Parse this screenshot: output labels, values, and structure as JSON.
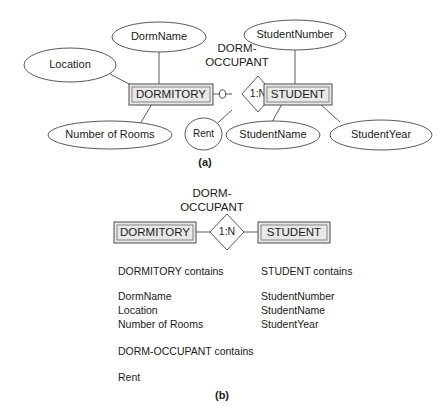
{
  "figure": {
    "panel_a_caption": "(a)",
    "panel_b_caption": "(b)"
  },
  "panel_a": {
    "entities": [
      {
        "id": "dormitory",
        "label": "DORMITORY"
      },
      {
        "id": "student",
        "label": "STUDENT"
      }
    ],
    "relationship": {
      "label_line1": "DORM-",
      "label_line2": "OCCUPANT",
      "cardinality": "1:N",
      "left_marker": "optional-zero-circle",
      "right_marker": "mandatory-one-tick"
    },
    "attributes": [
      {
        "id": "location",
        "label": "Location",
        "owner": "dormitory"
      },
      {
        "id": "dormname",
        "label": "DormName",
        "owner": "dormitory"
      },
      {
        "id": "numrooms",
        "label": "Number of Rooms",
        "owner": "dormitory"
      },
      {
        "id": "studentnumber",
        "label": "StudentNumber",
        "owner": "student"
      },
      {
        "id": "studentname",
        "label": "StudentName",
        "owner": "student"
      },
      {
        "id": "studentyear",
        "label": "StudentYear",
        "owner": "student"
      },
      {
        "id": "rent",
        "label": "Rent",
        "owner": "dorm-occupant"
      }
    ]
  },
  "panel_b": {
    "entities": [
      {
        "id": "dormitory",
        "label": "DORMITORY"
      },
      {
        "id": "student",
        "label": "STUDENT"
      }
    ],
    "relationship": {
      "label_line1": "DORM-",
      "label_line2": "OCCUPANT",
      "cardinality": "1:N"
    },
    "lists": [
      {
        "id": "dormitory-contains",
        "heading": "DORMITORY contains",
        "items": [
          "DormName",
          "Location",
          "Number of Rooms"
        ]
      },
      {
        "id": "student-contains",
        "heading": "STUDENT contains",
        "items": [
          "StudentNumber",
          "StudentName",
          "StudentYear"
        ]
      },
      {
        "id": "dorm-occupant-contains",
        "heading": "DORM-OCCUPANT contains",
        "items": [
          "Rent"
        ]
      }
    ]
  },
  "colors": {
    "entity_fill": "#e8e8e8",
    "shape_stroke": "#5a5a5a",
    "text": "#1a1a1a",
    "background": "#ffffff"
  }
}
